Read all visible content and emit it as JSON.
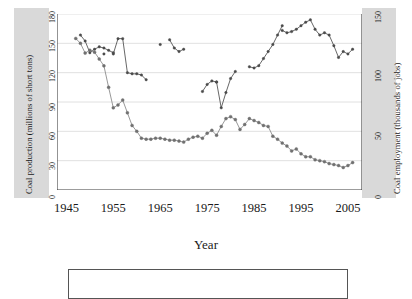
{
  "chart_data": {
    "type": "line",
    "title": "",
    "xlabel": "Year",
    "grid": "horizontal",
    "legend": "none",
    "xlim": [
      1943,
      2008
    ],
    "xticks": [
      1945,
      1955,
      1965,
      1975,
      1985,
      1995,
      2005
    ],
    "axes": {
      "left": {
        "label": "Coal production (millions of short tons)",
        "ticks": [
          0,
          30,
          60,
          90,
          120,
          150,
          180
        ],
        "ylim": [
          0,
          180
        ]
      },
      "right": {
        "label": "Coal employment (thousands of jobs)",
        "ticks": [
          0,
          50,
          100,
          150
        ],
        "ylim": [
          0,
          150
        ]
      }
    },
    "series": [
      {
        "name": "Coal production",
        "axis": "left",
        "units": "millions of short tons",
        "color": "#8c8c8c",
        "marker_color": "#707070",
        "x": [
          1947,
          1948,
          1949,
          1950,
          1951,
          1952,
          1953,
          1954,
          1955,
          1956,
          1957,
          1958,
          1959,
          1960,
          1961,
          1962,
          1963,
          1964,
          1965,
          1966,
          1967,
          1968,
          1969,
          1970,
          1971,
          1972,
          1973,
          1974,
          1975,
          1976,
          1977,
          1978,
          1979,
          1980,
          1981,
          1982,
          1983,
          1984,
          1985,
          1986,
          1987,
          1988,
          1989,
          1990,
          1991,
          1992,
          1993,
          1994,
          1995,
          1996,
          1997,
          1998,
          1999,
          2000,
          2001,
          2002,
          2003,
          2004,
          2005,
          2006
        ],
        "y": [
          155,
          150,
          140,
          143,
          141,
          134,
          127,
          105,
          84,
          87,
          92,
          79,
          66,
          60,
          53,
          52,
          52,
          53,
          53,
          52,
          51,
          51,
          50,
          49,
          52,
          54,
          55,
          53,
          58,
          61,
          56,
          65,
          73,
          75,
          72,
          62,
          67,
          73,
          71,
          69,
          66,
          65,
          55,
          52,
          48,
          45,
          40,
          42,
          37,
          34,
          34,
          31,
          30,
          29,
          27,
          26,
          25,
          23,
          25,
          28
        ]
      },
      {
        "name": "Coal employment",
        "axis": "right",
        "units": "thousands of jobs",
        "color": "#565656",
        "marker_color": "#4a4a4a",
        "segments": [
          {
            "x": [
              1948,
              1949,
              1950,
              1951,
              1952,
              1953,
              1954,
              1955
            ],
            "y": [
              132,
              127,
              117,
              120,
              122,
              121,
              119,
              117
            ]
          },
          {
            "x": [
              1953
            ],
            "y": [
              116
            ]
          },
          {
            "x": [
              1955,
              1956,
              1957,
              1958,
              1959,
              1960,
              1961,
              1962
            ],
            "y": [
              116,
              129,
              129,
              100,
              99,
              99,
              98,
              94
            ]
          },
          {
            "x": [
              1965
            ],
            "y": [
              124
            ]
          },
          {
            "x": [
              1967,
              1968,
              1969,
              1970
            ],
            "y": [
              128,
              121,
              118,
              120
            ]
          },
          {
            "x": [
              1974,
              1975,
              1976,
              1977
            ],
            "y": [
              84,
              90,
              93,
              92
            ]
          },
          {
            "x": [
              1977,
              1978,
              1979,
              1980,
              1981
            ],
            "y": [
              92,
              70,
              83,
              95,
              101
            ]
          },
          {
            "x": [
              1984,
              1985,
              1986,
              1987,
              1988,
              1989,
              1990,
              1991
            ],
            "y": [
              105,
              104,
              106,
              112,
              118,
              124,
              132,
              140
            ]
          },
          {
            "x": [
              1991,
              1992,
              1993,
              1994,
              1995,
              1996,
              1997,
              1998,
              1999,
              2000,
              2001,
              2002,
              2003,
              2004,
              2005,
              2006
            ],
            "y": [
              136,
              134,
              135,
              137,
              140,
              143,
              145,
              137,
              132,
              134,
              132,
              123,
              113,
              118,
              116,
              120
            ]
          }
        ]
      }
    ]
  },
  "labels": {
    "xticks": [
      "1945",
      "1955",
      "1965",
      "1975",
      "1985",
      "1995",
      "2005"
    ],
    "left_ticks": [
      "0",
      "30",
      "60",
      "90",
      "120",
      "150",
      "180"
    ],
    "right_ticks": [
      "0",
      "50",
      "100",
      "150"
    ],
    "xtitle": "Year",
    "ytitle_left": "Coal production (millions of short tons)",
    "ytitle_right": "Coal employment (thousands of jobs)"
  }
}
